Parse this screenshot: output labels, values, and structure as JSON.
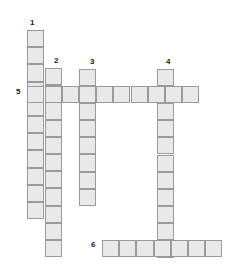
{
  "puzzle": {
    "title": "Crossword Grid",
    "cell_size": 17.2,
    "origin_x": 27.3,
    "origin_y": 30.0,
    "colors": {
      "cell_fill": "#e9e9e9",
      "cell_border": "#9a9a9a",
      "background": "#ffffff",
      "number_color": "#222222"
    },
    "numbers": [
      {
        "label": "1",
        "x": 30,
        "y": 19,
        "direction": "down",
        "length": 11
      },
      {
        "label": "2",
        "x": 54,
        "y": 57,
        "direction": "down",
        "length": 11
      },
      {
        "label": "3",
        "x": 90,
        "y": 58,
        "direction": "down",
        "length": 8
      },
      {
        "label": "4",
        "x": 166,
        "y": 58,
        "direction": "down",
        "length": 12
      },
      {
        "label": "5",
        "x": 16,
        "y": 88,
        "direction": "across",
        "length": 10
      },
      {
        "label": "6",
        "x": 91,
        "y": 241,
        "direction": "across",
        "length": 7
      }
    ],
    "entries": [
      {
        "name": "entry-1-down",
        "number": "1",
        "orientation": "vertical",
        "x": 27.3,
        "y": 30.0,
        "cells": 11
      },
      {
        "name": "entry-2-down",
        "number": "2",
        "orientation": "vertical",
        "x": 44.5,
        "y": 68.0,
        "cells": 11
      },
      {
        "name": "entry-3-down-a",
        "number": "3",
        "orientation": "vertical",
        "x": 79.0,
        "y": 68.5,
        "cells": 3
      },
      {
        "name": "entry-3-down-b",
        "number": "3",
        "orientation": "vertical",
        "x": 79.0,
        "y": 120.0,
        "cells": 5
      },
      {
        "name": "entry-4-down",
        "number": "4",
        "orientation": "vertical",
        "x": 157.0,
        "y": 68.5,
        "cells": 11
      },
      {
        "name": "entry-5-across",
        "number": "5",
        "orientation": "horizontal",
        "x": 27.3,
        "y": 85.8,
        "cells": 10
      },
      {
        "name": "entry-6-across",
        "number": "6",
        "orientation": "horizontal",
        "x": 102.0,
        "y": 239.6,
        "cells": 7
      }
    ]
  }
}
